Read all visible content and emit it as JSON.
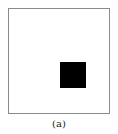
{
  "figure": {
    "caption": "(a)",
    "frame": {
      "border_color": "#8a8a8a",
      "fill": "#ffffff"
    },
    "square": {
      "color": "#000000"
    }
  }
}
